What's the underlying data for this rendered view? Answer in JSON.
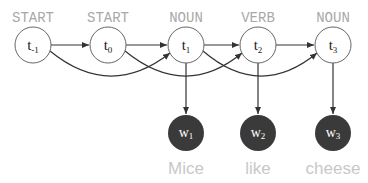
{
  "diagram": {
    "type": "hmm-trigram-graph",
    "colors": {
      "hidden_stroke": "#555555",
      "observed_fill": "#3a3a3a",
      "tag_text": "#a8a8a8",
      "word_text": "#c8c8c8",
      "edge": "#333333"
    },
    "hidden_nodes": [
      {
        "id": "t-1",
        "base": "t",
        "sub": "-1",
        "tag": "START"
      },
      {
        "id": "t0",
        "base": "t",
        "sub": "0",
        "tag": "START"
      },
      {
        "id": "t1",
        "base": "t",
        "sub": "1",
        "tag": "NOUN"
      },
      {
        "id": "t2",
        "base": "t",
        "sub": "2",
        "tag": "VERB"
      },
      {
        "id": "t3",
        "base": "t",
        "sub": "3",
        "tag": "NOUN"
      }
    ],
    "observed_nodes": [
      {
        "id": "w1",
        "base": "w",
        "sub": "1",
        "word": "Mice"
      },
      {
        "id": "w2",
        "base": "w",
        "sub": "2",
        "word": "like"
      },
      {
        "id": "w3",
        "base": "w",
        "sub": "3",
        "word": "cheese"
      }
    ],
    "edges": [
      {
        "from": "t-1",
        "to": "t0",
        "style": "straight"
      },
      {
        "from": "t0",
        "to": "t1",
        "style": "straight"
      },
      {
        "from": "t1",
        "to": "t2",
        "style": "straight"
      },
      {
        "from": "t2",
        "to": "t3",
        "style": "straight"
      },
      {
        "from": "t-1",
        "to": "t1",
        "style": "curved"
      },
      {
        "from": "t0",
        "to": "t2",
        "style": "curved"
      },
      {
        "from": "t1",
        "to": "t3",
        "style": "curved"
      },
      {
        "from": "t1",
        "to": "w1",
        "style": "straight"
      },
      {
        "from": "t2",
        "to": "w2",
        "style": "straight"
      },
      {
        "from": "t3",
        "to": "w3",
        "style": "straight"
      }
    ]
  }
}
